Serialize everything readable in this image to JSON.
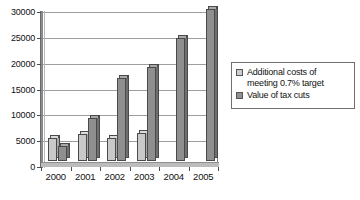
{
  "chart_data": {
    "type": "bar",
    "title": "",
    "subtitle": "",
    "xlabel": "",
    "ylabel": "",
    "categories": [
      "2000",
      "2001",
      "2002",
      "2003",
      "2004",
      "2005"
    ],
    "series": [
      {
        "name": "Additional costs of meeting 0.7% target",
        "color": "#c9c9c9",
        "values": [
          4400,
          5200,
          4500,
          5500,
          0,
          0
        ]
      },
      {
        "name": "Value of tax cuts",
        "color": "#8f8f8f",
        "values": [
          3000,
          8400,
          16000,
          18200,
          23800,
          29500
        ]
      }
    ],
    "ylim": [
      0,
      30000
    ],
    "ytick_values": [
      0,
      5000,
      10000,
      15000,
      20000,
      25000,
      30000
    ],
    "ytick_labels": [
      "0",
      "5000",
      "10000",
      "15000",
      "20000",
      "25000",
      "30000"
    ],
    "grid": true,
    "legend_position": "right"
  },
  "legend": {
    "entries": [
      {
        "label_line1": "Additional costs of",
        "label_line2": "meeting 0.7% target",
        "swatch": "costs-swatch"
      },
      {
        "label_line1": "Value of tax cuts",
        "label_line2": "",
        "swatch": "tax-swatch"
      }
    ]
  }
}
